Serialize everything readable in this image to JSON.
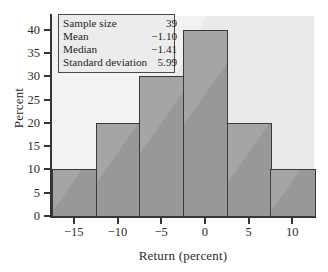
{
  "chart_data": {
    "type": "bar",
    "title": "",
    "xlabel": "Return (percent)",
    "ylabel": "Percent",
    "categories": [
      "-15",
      "-10",
      "-5",
      "0",
      "5",
      "10"
    ],
    "values": [
      10,
      20,
      30,
      40,
      20,
      10
    ],
    "bin_edges": [
      -17.5,
      -12.5,
      -7.5,
      -2.5,
      2.5,
      7.5,
      12.5
    ],
    "bin_width": 5,
    "xlim": [
      -17.5,
      12.5
    ],
    "ylim": [
      0,
      43
    ],
    "xticks": [
      "-15",
      "-10",
      "-5",
      "0",
      "5",
      "10"
    ],
    "xtick_values": [
      -15,
      -10,
      -5,
      0,
      5,
      10
    ],
    "yticks": [
      "0",
      "5",
      "10",
      "15",
      "20",
      "25",
      "30",
      "35",
      "40"
    ],
    "ytick_values": [
      0,
      5,
      10,
      15,
      20,
      25,
      30,
      35,
      40
    ],
    "grid": false,
    "legend": "none",
    "bar_color": "#9b9b9b",
    "bar_edge_color": "#3a3a3c",
    "plot_background": "#ececed"
  },
  "stats_box": {
    "rows": [
      {
        "label": "Sample size",
        "value": "39"
      },
      {
        "label": "Mean",
        "value": "−1.10"
      },
      {
        "label": "Median",
        "value": "−1.41"
      },
      {
        "label": "Standard deviation",
        "value": "5.99"
      }
    ]
  }
}
